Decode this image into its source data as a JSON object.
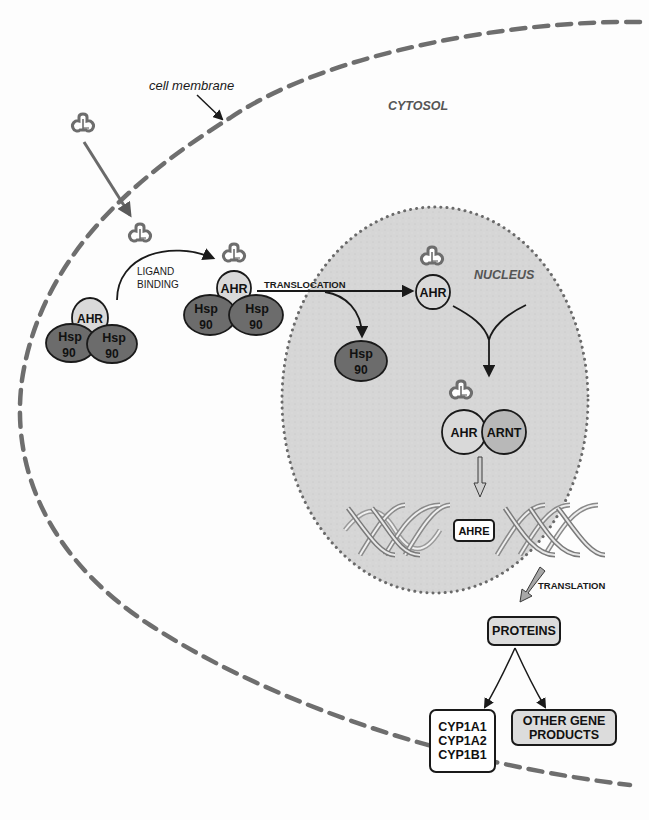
{
  "labels": {
    "cell_membrane": "cell membrane",
    "cytosol": "CYTOSOL",
    "nucleus": "NUCLEUS",
    "ligand_binding_line1": "LIGAND",
    "ligand_binding_line2": "BINDING",
    "translocation": "TRANSLOCATION",
    "translation": "TRANSLATION"
  },
  "complexes": {
    "inactive": {
      "ahr": "AHR",
      "hsp_left_1": "Hsp",
      "hsp_left_2": "90",
      "hsp_right_1": "Hsp",
      "hsp_right_2": "90"
    },
    "ligand_bound": {
      "ahr": "AHR",
      "hsp_left_1": "Hsp",
      "hsp_left_2": "90",
      "hsp_right_1": "Hsp",
      "hsp_right_2": "90"
    },
    "released_hsp": {
      "line1": "Hsp",
      "line2": "90"
    },
    "nuclear_ahr": {
      "ahr": "AHR"
    },
    "heterodimer": {
      "ahr": "AHR",
      "arnt": "ARNT"
    }
  },
  "dna": {
    "element": "AHRE"
  },
  "outputs": {
    "proteins": "PROTEINS",
    "cyp_list": [
      "CYP1A1",
      "CYP1A2",
      "CYP1B1"
    ],
    "other_line1": "OTHER GENE",
    "other_line2": "PRODUCTS"
  },
  "colors": {
    "membrane": "#6e6e6e",
    "nucleus_fill": "#d6d6d6",
    "nucleus_border": "#6a6a6a",
    "hsp_fill": "#6c6c6c",
    "ahr_fill": "#d9d9d9",
    "arnt_fill": "#b8b8b8",
    "ligand_stroke": "#6d6d6d"
  }
}
